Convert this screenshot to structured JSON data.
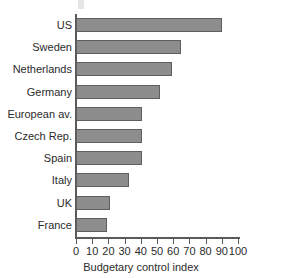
{
  "chart_data": {
    "type": "bar",
    "orientation": "horizontal",
    "title": "",
    "xlabel": "Budgetary control index",
    "ylabel": "",
    "categories": [
      "US",
      "Sweden",
      "Netherlands",
      "Germany",
      "European av.",
      "Czech Rep.",
      "Spain",
      "Italy",
      "UK",
      "France"
    ],
    "values": [
      90,
      65,
      59,
      52,
      41,
      41,
      41,
      33,
      21,
      19
    ],
    "xlim": [
      0,
      100
    ],
    "xticks": [
      0,
      10,
      20,
      30,
      40,
      50,
      60,
      70,
      80,
      90,
      100
    ],
    "xtick_labels": [
      "0",
      "10",
      "20",
      "30",
      "40",
      "50",
      "60",
      "70",
      "80",
      "90",
      "100"
    ],
    "grid": false,
    "legend": null,
    "bar_color": "#8d8d8d",
    "bar_edge_color": "#5e5e5e",
    "axis_color": "#5a5a5a",
    "text_color": "#2b2b2b"
  }
}
